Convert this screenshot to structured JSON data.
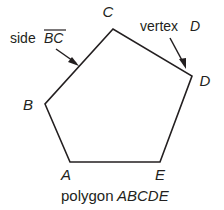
{
  "figure": {
    "kind": "geometry-diagram",
    "shape_name": "pentagon",
    "stroke_color": "#231f20",
    "background_color": "#ffffff",
    "caption": {
      "plain": "polygon",
      "italic": "ABCDE",
      "full": "polygon ABCDE"
    },
    "vertices": [
      {
        "id": "A",
        "label": "A",
        "x": 70,
        "y": 162,
        "label_x": 66,
        "label_y": 180
      },
      {
        "id": "B",
        "label": "B",
        "x": 45,
        "y": 104,
        "label_x": 28,
        "label_y": 110
      },
      {
        "id": "C",
        "label": "C",
        "x": 113,
        "y": 29,
        "label_x": 108,
        "label_y": 17
      },
      {
        "id": "D",
        "label": "D",
        "x": 192,
        "y": 76,
        "label_x": 202,
        "label_y": 86
      },
      {
        "id": "E",
        "label": "E",
        "x": 160,
        "y": 162,
        "label_x": 158,
        "label_y": 180
      }
    ],
    "edges": [
      {
        "from": "A",
        "to": "B"
      },
      {
        "from": "B",
        "to": "C"
      },
      {
        "from": "C",
        "to": "D"
      },
      {
        "from": "D",
        "to": "E"
      },
      {
        "from": "E",
        "to": "A"
      }
    ],
    "annotations": [
      {
        "id": "side-bc",
        "plain": "side",
        "italic": "BC",
        "overline": true,
        "full": "side BC",
        "text_x": 10,
        "text_y": 43,
        "arrow_from_x": 56,
        "arrow_from_y": 49,
        "arrow_to_x": 79,
        "arrow_to_y": 66,
        "points_to": "edge BC"
      },
      {
        "id": "vertex-d",
        "plain": "vertex",
        "italic": "D",
        "overline": false,
        "full": "vertex D",
        "text_x": 140,
        "text_y": 31,
        "arrow_from_x": 170,
        "arrow_from_y": 38,
        "arrow_to_x": 186,
        "arrow_to_y": 69,
        "points_to": "vertex D"
      }
    ]
  }
}
